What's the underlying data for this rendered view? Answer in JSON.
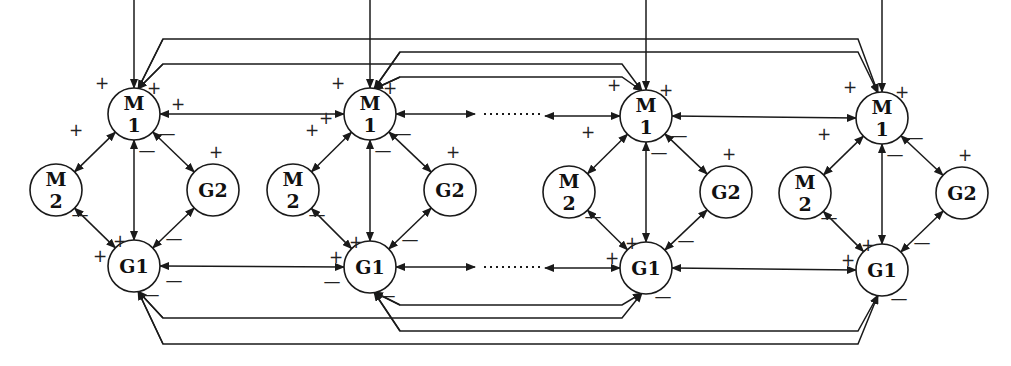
{
  "diagram": {
    "title": "",
    "modules": [
      {
        "id": "mod1",
        "nodes": {
          "M1": {
            "cx": 134,
            "cy": 114,
            "label": [
              "M",
              "1"
            ]
          },
          "M2": {
            "cx": 56,
            "cy": 190,
            "label": [
              "M",
              "2"
            ]
          },
          "G2": {
            "cx": 213,
            "cy": 190,
            "label": [
              "G2"
            ]
          },
          "G1": {
            "cx": 134,
            "cy": 266,
            "label": [
              "G1"
            ]
          }
        }
      },
      {
        "id": "mod2",
        "nodes": {
          "M1": {
            "cx": 370,
            "cy": 114,
            "label": [
              "M",
              "1"
            ]
          },
          "M2": {
            "cx": 293,
            "cy": 190,
            "label": [
              "M",
              "2"
            ]
          },
          "G2": {
            "cx": 450,
            "cy": 190,
            "label": [
              "G2"
            ]
          },
          "G1": {
            "cx": 370,
            "cy": 267,
            "label": [
              "G1"
            ]
          }
        }
      },
      {
        "id": "mod3",
        "nodes": {
          "M1": {
            "cx": 646,
            "cy": 116,
            "label": [
              "M",
              "1"
            ]
          },
          "M2": {
            "cx": 569,
            "cy": 192,
            "label": [
              "M",
              "2"
            ]
          },
          "G2": {
            "cx": 726,
            "cy": 192,
            "label": [
              "G2"
            ]
          },
          "G1": {
            "cx": 646,
            "cy": 268,
            "label": [
              "G1"
            ]
          }
        }
      },
      {
        "id": "mod4",
        "nodes": {
          "M1": {
            "cx": 882,
            "cy": 118,
            "label": [
              "M",
              "1"
            ]
          },
          "M2": {
            "cx": 805,
            "cy": 193,
            "label": [
              "M",
              "2"
            ]
          },
          "G2": {
            "cx": 962,
            "cy": 193,
            "label": [
              "G2"
            ]
          },
          "G1": {
            "cx": 882,
            "cy": 270,
            "label": [
              "G1"
            ]
          }
        }
      }
    ],
    "node_radius": 26,
    "signs": {
      "plus": "+",
      "minus": "—"
    },
    "ellipsis": "………",
    "intra_module_edges": [
      {
        "from": "M1",
        "to": "M2",
        "sign": "+",
        "type": "bidirectional"
      },
      {
        "from": "M1",
        "to": "G2",
        "sign": "+",
        "type": "bidirectional"
      },
      {
        "from": "M1",
        "to": "G1",
        "sign": "+",
        "type": "bidirectional"
      },
      {
        "from": "M2",
        "to": "G1",
        "sign": "+",
        "type": "bidirectional"
      },
      {
        "from": "G2",
        "to": "G1",
        "sign": "—",
        "type": "bidirectional"
      }
    ],
    "inter_module_edges": [
      {
        "from": "mod1.M1",
        "to": "mod2.M1",
        "type": "bidirectional"
      },
      {
        "from": "mod1.G1",
        "to": "mod2.G1",
        "type": "bidirectional"
      },
      {
        "from": "mod2.M1",
        "to": "mod3.M1",
        "type": "bidirectional-ellipsis"
      },
      {
        "from": "mod2.G1",
        "to": "mod3.G1",
        "type": "bidirectional-ellipsis"
      },
      {
        "from": "mod3.M1",
        "to": "mod4.M1",
        "type": "bidirectional"
      },
      {
        "from": "mod3.G1",
        "to": "mod4.G1",
        "type": "bidirectional"
      },
      {
        "from": "mod1.M1",
        "to": "mod4.M1",
        "type": "long-range-top"
      },
      {
        "from": "mod2.M1",
        "to": "mod4.M1",
        "type": "long-range-top"
      },
      {
        "from": "mod1.M1",
        "to": "mod3.M1",
        "type": "long-range-top"
      },
      {
        "from": "mod2.M1",
        "to": "mod3.M1",
        "type": "long-range-top"
      },
      {
        "from": "mod1.G1",
        "to": "mod4.G1",
        "type": "long-range-bottom"
      },
      {
        "from": "mod2.G1",
        "to": "mod4.G1",
        "type": "long-range-bottom"
      },
      {
        "from": "mod1.G1",
        "to": "mod3.G1",
        "type": "long-range-bottom"
      },
      {
        "from": "mod2.G1",
        "to": "mod3.G1",
        "type": "long-range-bottom"
      }
    ],
    "external_inputs": [
      {
        "to": "mod1.M1"
      },
      {
        "to": "mod2.M1"
      },
      {
        "to": "mod3.M1"
      },
      {
        "to": "mod4.M1"
      }
    ]
  }
}
